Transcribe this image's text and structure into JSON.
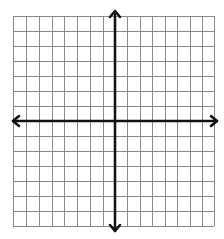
{
  "diagram": {
    "type": "coordinate-plane",
    "grid": {
      "columns_left_of_y_axis": 8,
      "columns_right_of_y_axis": 8,
      "rows_above_x_axis": 7,
      "rows_below_x_axis": 7,
      "x_lines": [
        13,
        26,
        39,
        52,
        64,
        77,
        90,
        103,
        115,
        127,
        140,
        152,
        165,
        177,
        190,
        202,
        214
      ],
      "y_lines": [
        16,
        31,
        46,
        61,
        76,
        91,
        106,
        121,
        136,
        151,
        166,
        181,
        196,
        211,
        226
      ],
      "line_color": "#8a8a8a",
      "line_width": 1
    },
    "axes": {
      "origin": [
        115,
        121
      ],
      "x_axis": {
        "from": 13,
        "to": 217,
        "arrows": "both"
      },
      "y_axis": {
        "from": 11,
        "to": 231,
        "arrows": "both"
      },
      "color": "#111111",
      "width": 2.5
    },
    "background": "#ffffff"
  }
}
